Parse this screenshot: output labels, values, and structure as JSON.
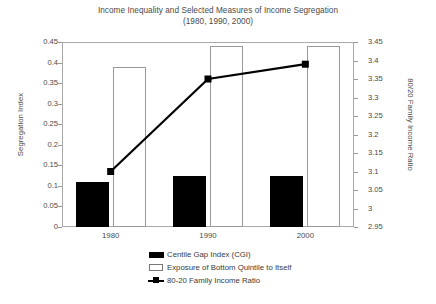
{
  "chart_data": {
    "type": "bar",
    "title": "Income Inequality and Selected Measures of Income Segregation",
    "subtitle": "(1980, 1990, 2000)",
    "categories": [
      "1980",
      "1990",
      "2000"
    ],
    "xlabel": "",
    "ylabel": "Segregation Index",
    "y2label": "80/20 Family Income Ratio",
    "ylim": [
      0,
      0.45
    ],
    "ytick_step": 0.05,
    "yticks": [
      "0.45",
      "0.4",
      "0.35",
      "0.3",
      "0.25",
      "0.2",
      "0.15",
      "0.1",
      "0.05",
      "0"
    ],
    "y2lim": [
      2.95,
      3.45
    ],
    "y2tick_step": 0.05,
    "y2ticks": [
      "3.45",
      "3.4",
      "3.35",
      "3.3",
      "3.25",
      "3.2",
      "3.15",
      "3.1",
      "3.05",
      "3",
      "2.95"
    ],
    "grid": false,
    "legend_position": "bottom",
    "series": [
      {
        "name": "Centile Gap Index (CGI)",
        "type": "bar",
        "axis": "left",
        "fill": "#000000",
        "values": [
          0.11,
          0.125,
          0.125
        ]
      },
      {
        "name": "Exposure of Bottom Quintile to Itself",
        "type": "bar",
        "axis": "left",
        "fill": "#ffffff",
        "values": [
          0.39,
          0.44,
          0.44
        ]
      },
      {
        "name": "80-20 Family Income Ratio",
        "type": "line",
        "axis": "right",
        "fill": "#000000",
        "values": [
          3.1,
          3.35,
          3.39
        ]
      }
    ]
  },
  "legend": {
    "items": [
      {
        "label": "Centile Gap Index (CGI)",
        "swatch": "filled-bar-swatch"
      },
      {
        "label": "Exposure of Bottom Quintile to Itself",
        "swatch": "hollow-bar-swatch"
      },
      {
        "label": "80-20 Family Income Ratio",
        "swatch": "line-marker-swatch"
      }
    ]
  }
}
